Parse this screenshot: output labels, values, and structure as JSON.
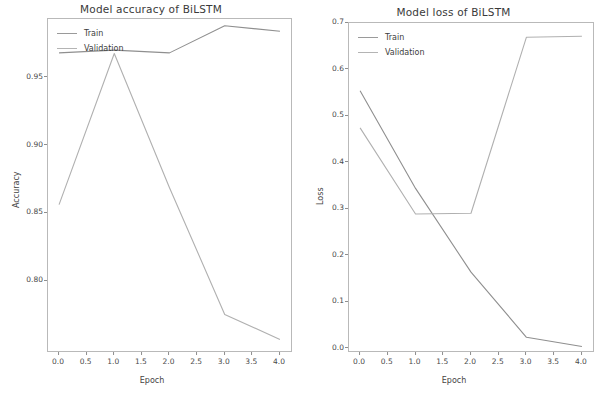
{
  "figure": {
    "background": "#ffffff",
    "line_color_train": "#8f8f8f",
    "line_color_validation": "#b0b0b0"
  },
  "panels": [
    {
      "id": "accuracy",
      "title": "Model accuracy of BiLSTM",
      "xlabel": "Epoch",
      "ylabel": "Accuracy",
      "legend": [
        "Train",
        "Validation"
      ],
      "yticks": [
        "0.80",
        "0.85",
        "0.90",
        "0.95"
      ],
      "xticks": [
        "0.0",
        "0.5",
        "1.0",
        "1.5",
        "2.0",
        "2.5",
        "3.0",
        "3.5",
        "4.0"
      ]
    },
    {
      "id": "loss",
      "title": "Model loss of BiLSTM",
      "xlabel": "Epoch",
      "ylabel": "Loss",
      "legend": [
        "Train",
        "Validation"
      ],
      "yticks": [
        "0.0",
        "0.1",
        "0.2",
        "0.3",
        "0.4",
        "0.5",
        "0.6",
        "0.7"
      ],
      "xticks": [
        "0.0",
        "0.5",
        "1.0",
        "1.5",
        "2.0",
        "2.5",
        "3.0",
        "3.5",
        "4.0"
      ]
    }
  ],
  "chart_data": [
    {
      "type": "line",
      "title": "Model accuracy of BiLSTM",
      "xlabel": "Epoch",
      "ylabel": "Accuracy",
      "x": [
        0,
        1,
        2,
        3,
        4
      ],
      "xlim": [
        -0.2,
        4.2
      ],
      "ylim": [
        0.7485,
        0.9935
      ],
      "grid": false,
      "legend_position": "upper left",
      "series": [
        {
          "name": "Train",
          "values": [
            0.9685,
            0.9705,
            0.9685,
            0.9885,
            0.9845
          ]
        },
        {
          "name": "Validation",
          "values": [
            0.8565,
            0.968,
            0.869,
            0.7755,
            0.757
          ]
        }
      ],
      "xticks": [
        0.0,
        0.5,
        1.0,
        1.5,
        2.0,
        2.5,
        3.0,
        3.5,
        4.0
      ],
      "yticks": [
        0.8,
        0.85,
        0.9,
        0.95
      ]
    },
    {
      "type": "line",
      "title": "Model loss of BiLSTM",
      "xlabel": "Epoch",
      "ylabel": "Loss",
      "x": [
        0,
        1,
        2,
        3,
        4
      ],
      "xlim": [
        -0.2,
        4.2
      ],
      "ylim": [
        -0.0045,
        0.7005
      ],
      "grid": false,
      "legend_position": "upper left",
      "series": [
        {
          "name": "Train",
          "values": [
            0.555,
            0.345,
            0.165,
            0.025,
            0.005
          ]
        },
        {
          "name": "Validation",
          "values": [
            0.475,
            0.29,
            0.2915,
            0.67,
            0.672
          ]
        }
      ],
      "xticks": [
        0.0,
        0.5,
        1.0,
        1.5,
        2.0,
        2.5,
        3.0,
        3.5,
        4.0
      ],
      "yticks": [
        0.0,
        0.1,
        0.2,
        0.3,
        0.4,
        0.5,
        0.6,
        0.7
      ]
    }
  ]
}
